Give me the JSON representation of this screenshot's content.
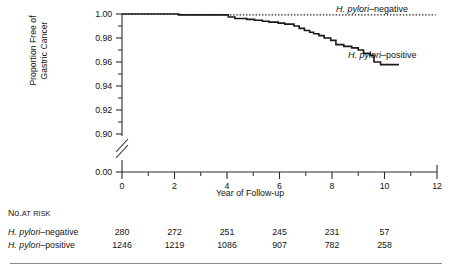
{
  "figure": {
    "kind": "kaplan-meier-survival-curve"
  },
  "axes": {
    "y": {
      "title_line1": "Proportion Free of",
      "title_line2": "Gastric Cancer",
      "tick_labels": [
        "1.00",
        "0.98",
        "0.96",
        "0.94",
        "0.92",
        "0.90",
        "0.00"
      ],
      "has_axis_break": true
    },
    "x": {
      "title": "Year of Follow-up",
      "tick_labels": [
        "0",
        "2",
        "4",
        "6",
        "8",
        "10",
        "12"
      ]
    }
  },
  "curve_labels": {
    "negative": {
      "species": "H. pylori",
      "suffix": "–negative"
    },
    "positive": {
      "species": "H. pylori",
      "suffix": "–positive"
    }
  },
  "risk_table": {
    "title_main": "No.",
    "title_small1": "AT",
    "title_small2": "RISK",
    "rows": [
      {
        "species": "H. pylori",
        "suffix": "–negative",
        "values": [
          "280",
          "272",
          "251",
          "245",
          "231",
          "57"
        ]
      },
      {
        "species": "H. pylori",
        "suffix": "–positive",
        "values": [
          "1246",
          "1219",
          "1086",
          "907",
          "782",
          "258"
        ]
      }
    ]
  },
  "chart_data": {
    "type": "line",
    "title": "",
    "xlabel": "Year of Follow-up",
    "ylabel": "Proportion Free of Gastric Cancer",
    "xlim": [
      0,
      12
    ],
    "ylim": [
      0.89,
      1.0
    ],
    "y_axis_break": {
      "below": 0.895,
      "shown_value": 0.0
    },
    "xticks": [
      0,
      2,
      4,
      6,
      8,
      10,
      12
    ],
    "xminorticks": [
      1,
      3,
      5,
      7,
      9,
      11
    ],
    "yticks": [
      1.0,
      0.98,
      0.96,
      0.94,
      0.92,
      0.9,
      0.0
    ],
    "grid": false,
    "legend_position": "inline-right-of-curves",
    "series": [
      {
        "name": "H. pylori-negative",
        "style": "dotted",
        "color": "#1a1a1a",
        "points": [
          [
            0.0,
            1.0
          ],
          [
            2.2,
            1.0
          ],
          [
            2.2,
            0.9993
          ],
          [
            4.05,
            0.9993
          ],
          [
            10.6,
            0.9993
          ],
          [
            11.95,
            0.9993
          ]
        ]
      },
      {
        "name": "H. pylori-positive",
        "style": "solid",
        "color": "#1a1a1a",
        "points": [
          [
            0.0,
            1.0
          ],
          [
            2.15,
            1.0
          ],
          [
            2.15,
            0.9993
          ],
          [
            4.05,
            0.9993
          ],
          [
            4.05,
            0.9975
          ],
          [
            4.3,
            0.9975
          ],
          [
            4.3,
            0.9963
          ],
          [
            4.75,
            0.9963
          ],
          [
            4.75,
            0.9955
          ],
          [
            5.05,
            0.9955
          ],
          [
            5.05,
            0.9948
          ],
          [
            5.35,
            0.9948
          ],
          [
            5.35,
            0.994
          ],
          [
            5.6,
            0.994
          ],
          [
            5.6,
            0.9932
          ],
          [
            5.95,
            0.9932
          ],
          [
            5.95,
            0.9924
          ],
          [
            6.2,
            0.9924
          ],
          [
            6.2,
            0.9916
          ],
          [
            6.55,
            0.9916
          ],
          [
            6.55,
            0.99
          ],
          [
            6.75,
            0.99
          ],
          [
            6.75,
            0.988
          ],
          [
            6.95,
            0.988
          ],
          [
            6.95,
            0.9862
          ],
          [
            7.15,
            0.9862
          ],
          [
            7.15,
            0.9848
          ],
          [
            7.3,
            0.9848
          ],
          [
            7.3,
            0.9836
          ],
          [
            7.5,
            0.9836
          ],
          [
            7.5,
            0.982
          ],
          [
            7.7,
            0.982
          ],
          [
            7.7,
            0.98
          ],
          [
            7.95,
            0.98
          ],
          [
            7.95,
            0.978
          ],
          [
            8.15,
            0.978
          ],
          [
            8.15,
            0.9745
          ],
          [
            8.45,
            0.9745
          ],
          [
            8.45,
            0.973
          ],
          [
            8.75,
            0.973
          ],
          [
            8.75,
            0.9718
          ],
          [
            9.0,
            0.9718
          ],
          [
            9.0,
            0.97
          ],
          [
            9.2,
            0.97
          ],
          [
            9.2,
            0.9672
          ],
          [
            9.45,
            0.9672
          ],
          [
            9.45,
            0.9655
          ],
          [
            9.6,
            0.9655
          ],
          [
            9.6,
            0.96
          ],
          [
            9.85,
            0.96
          ],
          [
            9.85,
            0.9578
          ],
          [
            10.55,
            0.9578
          ]
        ]
      }
    ]
  }
}
